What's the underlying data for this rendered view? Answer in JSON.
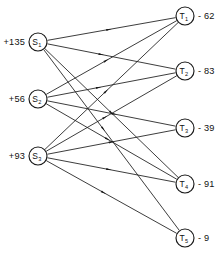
{
  "diagram": {
    "type": "transportation-network",
    "title": "",
    "supply_nodes": [
      {
        "id": "S1",
        "label": "S",
        "subscript": "1",
        "value": "+135",
        "x": 38,
        "y": 42,
        "r": 9
      },
      {
        "id": "S2",
        "label": "S",
        "subscript": "2",
        "value": "+56",
        "x": 38,
        "y": 99,
        "r": 9
      },
      {
        "id": "S3",
        "label": "S",
        "subscript": "3",
        "value": "+93",
        "x": 38,
        "y": 156,
        "r": 9
      }
    ],
    "demand_nodes": [
      {
        "id": "T1",
        "label": "T",
        "subscript": "1",
        "value": "- 62",
        "x": 185,
        "y": 16,
        "r": 9
      },
      {
        "id": "T2",
        "label": "T",
        "subscript": "2",
        "value": "- 83",
        "x": 185,
        "y": 71,
        "r": 9
      },
      {
        "id": "T3",
        "label": "T",
        "subscript": "3",
        "value": "- 39",
        "x": 185,
        "y": 128,
        "r": 9
      },
      {
        "id": "T4",
        "label": "T",
        "subscript": "4",
        "value": "- 91",
        "x": 185,
        "y": 184,
        "r": 9
      },
      {
        "id": "T5",
        "label": "T",
        "subscript": "5",
        "value": "- 9",
        "x": 185,
        "y": 238,
        "r": 9
      }
    ],
    "arcs": [
      {
        "from": "S1",
        "to": "T1",
        "arrow_at": 0.48
      },
      {
        "from": "S1",
        "to": "T2",
        "arrow_at": 0.42
      },
      {
        "from": "S1",
        "to": "T4",
        "arrow_at": 0.5
      },
      {
        "from": "S1",
        "to": "T5",
        "arrow_at": 0.44
      },
      {
        "from": "S2",
        "to": "T1",
        "arrow_at": 0.46
      },
      {
        "from": "S2",
        "to": "T2",
        "arrow_at": 0.4
      },
      {
        "from": "S2",
        "to": "T3",
        "arrow_at": 0.52
      },
      {
        "from": "S2",
        "to": "T4",
        "arrow_at": 0.47
      },
      {
        "from": "S3",
        "to": "T1",
        "arrow_at": 0.46
      },
      {
        "from": "S3",
        "to": "T2",
        "arrow_at": 0.45
      },
      {
        "from": "S3",
        "to": "T3",
        "arrow_at": 0.5
      },
      {
        "from": "S3",
        "to": "T4",
        "arrow_at": 0.48
      },
      {
        "from": "S3",
        "to": "T5",
        "arrow_at": 0.44
      }
    ],
    "value_label_offsets": {
      "supply_dx": -13,
      "demand_dx": 13
    }
  }
}
